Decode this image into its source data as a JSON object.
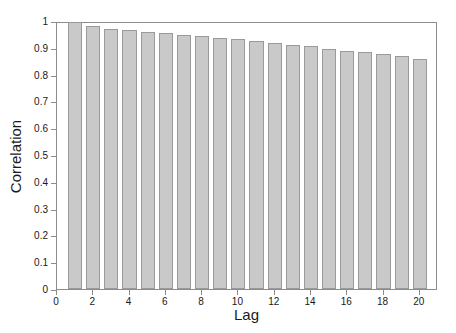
{
  "chart_data": {
    "type": "bar",
    "title": "",
    "subtitle": "",
    "xlabel": "Lag",
    "ylabel": "Correlation",
    "categories": [
      1,
      2,
      3,
      4,
      5,
      6,
      7,
      8,
      9,
      10,
      11,
      12,
      13,
      14,
      15,
      16,
      17,
      18,
      19,
      20
    ],
    "values": [
      0.995,
      0.981,
      0.972,
      0.968,
      0.958,
      0.955,
      0.948,
      0.944,
      0.937,
      0.932,
      0.924,
      0.918,
      0.911,
      0.906,
      0.896,
      0.889,
      0.884,
      0.877,
      0.869,
      0.857
    ],
    "xlim": [
      0,
      21
    ],
    "ylim": [
      0,
      1
    ],
    "x_ticks": [
      0,
      2,
      4,
      6,
      8,
      10,
      12,
      14,
      16,
      18,
      20
    ],
    "x_tick_labels": [
      "0",
      "2",
      "4",
      "6",
      "8",
      "10",
      "12",
      "14",
      "16",
      "18",
      "20"
    ],
    "y_ticks": [
      0,
      0.1,
      0.2,
      0.3,
      0.4,
      0.5,
      0.6,
      0.7,
      0.8,
      0.9,
      1
    ],
    "y_tick_labels": [
      "0",
      "0.1",
      "0.2",
      "0.3",
      "0.4",
      "0.5",
      "0.6",
      "0.7",
      "0.8",
      "0.9",
      "1"
    ],
    "grid": false,
    "legend": null,
    "bar_color": "#c9c9c9",
    "bar_edge_color": "#9a9a9a",
    "axis_color": "#8c8c8c",
    "background": "#ffffff"
  }
}
